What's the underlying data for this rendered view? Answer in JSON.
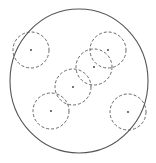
{
  "diagram": {
    "background": "#ffffff",
    "stroke_color": "#555555",
    "boundary": {
      "cx": 79,
      "cy": 81,
      "rx": 69,
      "ry": 72
    },
    "neighborhood_radius": 18,
    "points": [
      {
        "id": "p1",
        "x": 31,
        "y": 50
      },
      {
        "id": "p2",
        "x": 108,
        "y": 50
      },
      {
        "id": "p3",
        "x": 94,
        "y": 67
      },
      {
        "id": "p4",
        "x": 73,
        "y": 87
      },
      {
        "id": "p5",
        "x": 51,
        "y": 111
      },
      {
        "id": "p6",
        "x": 128,
        "y": 112
      }
    ]
  }
}
